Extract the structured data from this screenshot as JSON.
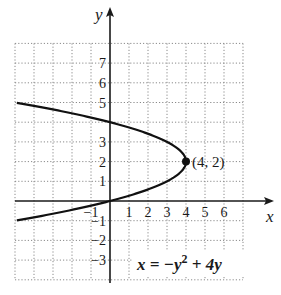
{
  "chart_data": {
    "type": "line",
    "title": "",
    "xlabel": "x",
    "ylabel": "y",
    "xlim": [
      -5,
      7
    ],
    "ylim": [
      -4,
      8
    ],
    "grid": true,
    "grid_style": "dotted",
    "x_ticks": [
      {
        "value": -1,
        "label": "−1"
      },
      {
        "value": 1,
        "label": "1"
      },
      {
        "value": 2,
        "label": "2"
      },
      {
        "value": 3,
        "label": "3"
      },
      {
        "value": 4,
        "label": "4"
      },
      {
        "value": 5,
        "label": "5"
      },
      {
        "value": 6,
        "label": "6"
      }
    ],
    "y_ticks": [
      {
        "value": -3,
        "label": "−3"
      },
      {
        "value": -2,
        "label": "−2"
      },
      {
        "value": -1,
        "label": "−1"
      },
      {
        "value": 1,
        "label": "1"
      },
      {
        "value": 2,
        "label": "2"
      },
      {
        "value": 3,
        "label": "3"
      },
      {
        "value": 5,
        "label": "5"
      },
      {
        "value": 6,
        "label": "6"
      },
      {
        "value": 7,
        "label": "7"
      }
    ],
    "series": [
      {
        "name": "x = −y² + 4y",
        "equation": "x = -y^2 + 4y",
        "param_y_range": [
          -1.1,
          5.1
        ],
        "color": "#111111"
      }
    ],
    "points": [
      {
        "x": 4,
        "y": 2,
        "label": "(4, 2)"
      }
    ],
    "annotations": {
      "equation_main": "x = −y",
      "equation_exp": "2",
      "equation_rest": " + 4y"
    }
  }
}
